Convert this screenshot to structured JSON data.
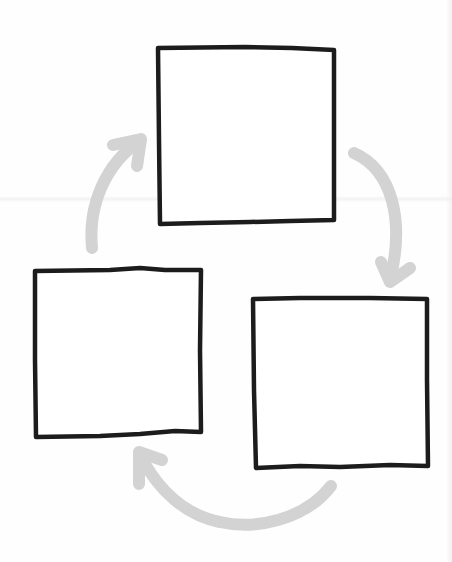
{
  "diagram": {
    "type": "cycle",
    "style": "hand-drawn",
    "direction": "clockwise",
    "colors": {
      "background": "#ffffff",
      "box_stroke": "#1c1c1c",
      "arrow": "#d3d3d3"
    },
    "nodes": [
      {
        "id": "top",
        "label": "",
        "x": 157,
        "y": 46,
        "width": 178,
        "height": 178
      },
      {
        "id": "right",
        "label": "",
        "x": 252,
        "y": 297,
        "width": 176,
        "height": 171
      },
      {
        "id": "left",
        "label": "",
        "x": 34,
        "y": 269,
        "width": 168,
        "height": 169
      }
    ],
    "edges": [
      {
        "from": "top",
        "to": "right"
      },
      {
        "from": "right",
        "to": "left"
      },
      {
        "from": "left",
        "to": "top"
      }
    ]
  }
}
